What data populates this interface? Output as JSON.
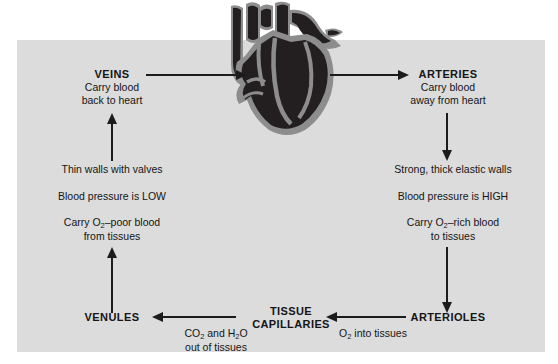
{
  "diagram": {
    "panel_color": "#dcdcdc",
    "background_color": "#ffffff",
    "arrow_color": "#1c1c1c",
    "text_color": "#151515"
  },
  "illustration": {
    "name": "heart-illustration",
    "fill_color": "#231f20",
    "outline_color": "#8a8a8a",
    "label": "heart"
  },
  "nodes": {
    "veins": {
      "heading": "VEINS",
      "line1": "Carry blood",
      "line2": "back to heart"
    },
    "arteries": {
      "heading": "ARTERIES",
      "line1": "Carry blood",
      "line2": "away from heart"
    },
    "venules": {
      "heading": "VENULES"
    },
    "tissue_capillaries": {
      "heading_line1": "TISSUE",
      "heading_line2": "CAPILLARIES"
    },
    "arterioles": {
      "heading": "ARTERIOLES"
    }
  },
  "vein_facts": {
    "fact1": "Thin walls with valves",
    "fact2": "Blood pressure is LOW",
    "fact3_pre": "Carry O",
    "fact3_sub": "2",
    "fact3_post": "–poor blood",
    "fact3_line2": "from tissues"
  },
  "artery_facts": {
    "fact1": "Strong, thick elastic walls",
    "fact2": "Blood pressure is HIGH",
    "fact3_pre": "Carry O",
    "fact3_sub": "2",
    "fact3_post": "–rich blood",
    "fact3_line2": "to tissues"
  },
  "exchange_labels": {
    "venous_pre": "CO",
    "venous_sub": "2",
    "venous_post": " and H",
    "venous_sub2": "2",
    "venous_post2": "O",
    "venous_line2": "out of tissues",
    "arterial_pre": "O",
    "arterial_sub": "2",
    "arterial_post": " into tissues"
  },
  "arrows": [
    {
      "name": "veins-to-heart",
      "direction": "right"
    },
    {
      "name": "heart-to-arteries",
      "direction": "right"
    },
    {
      "name": "venules-to-veins",
      "direction": "up"
    },
    {
      "name": "arteries-to-arterioles",
      "direction": "down"
    },
    {
      "name": "capillaries-to-venules",
      "direction": "left"
    },
    {
      "name": "arterioles-to-capillaries",
      "direction": "left"
    },
    {
      "name": "veins-facts-connector",
      "direction": "up"
    },
    {
      "name": "arteries-facts-connector",
      "direction": "down"
    }
  ]
}
